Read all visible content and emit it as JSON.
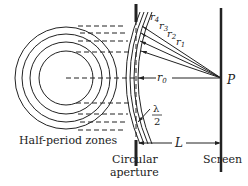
{
  "diagram": {
    "labels": {
      "zones": "Half-period zones",
      "aperture_line1": "Circular",
      "aperture_line2": "aperture",
      "screen": "Screen",
      "point": "P",
      "distance": "L",
      "r0": "r",
      "r0_sub": "0",
      "r1": "r",
      "r1_sub": "1",
      "r2": "r",
      "r2_sub": "2",
      "r3": "r",
      "r3_sub": "3",
      "r4": "r",
      "r4_sub": "4",
      "lambda_num": "λ",
      "lambda_den": "2"
    },
    "colors": {
      "ink": "#222222",
      "background": "#ffffff"
    }
  }
}
